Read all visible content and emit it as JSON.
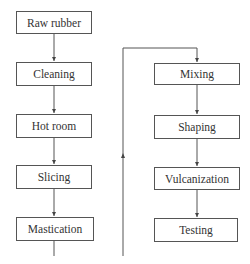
{
  "diagram": {
    "type": "flowchart",
    "title": "",
    "left_column": [
      {
        "id": "raw-rubber",
        "label": "Raw rubber"
      },
      {
        "id": "cleaning",
        "label": "Cleaning"
      },
      {
        "id": "hot-room",
        "label": "Hot room"
      },
      {
        "id": "slicing",
        "label": "Slicing"
      },
      {
        "id": "mastication",
        "label": "Mastication"
      }
    ],
    "right_column": [
      {
        "id": "mixing",
        "label": "Mixing"
      },
      {
        "id": "shaping",
        "label": "Shaping"
      },
      {
        "id": "vulcanization",
        "label": "Vulcanization"
      },
      {
        "id": "testing",
        "label": "Testing"
      }
    ],
    "edges": [
      {
        "from": "Raw rubber",
        "to": "Cleaning"
      },
      {
        "from": "Cleaning",
        "to": "Hot room"
      },
      {
        "from": "Hot room",
        "to": "Slicing"
      },
      {
        "from": "Slicing",
        "to": "Mastication"
      },
      {
        "from": "Mastication",
        "to": "Mixing"
      },
      {
        "from": "Mixing",
        "to": "Shaping"
      },
      {
        "from": "Shaping",
        "to": "Vulcanization"
      },
      {
        "from": "Vulcanization",
        "to": "Testing"
      }
    ],
    "colors": {
      "line": "#555555",
      "text": "#333333",
      "background": "#ffffff"
    }
  }
}
